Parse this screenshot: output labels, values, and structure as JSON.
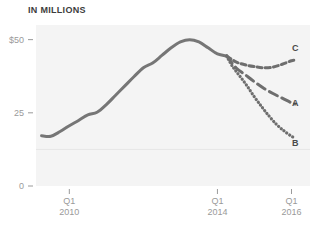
{
  "chart_data": {
    "type": "line",
    "title": "IN MILLIONS",
    "xlabel": "",
    "ylabel": "",
    "ylim": [
      0,
      55
    ],
    "yticks": [
      {
        "value": 50,
        "label": "$50"
      },
      {
        "value": 25,
        "label": "25"
      },
      {
        "value": 0,
        "label": "0"
      }
    ],
    "gridlines": [
      12.5
    ],
    "grid": true,
    "legend_position": "right-inline",
    "xticks": [
      {
        "x": 2010.0,
        "line1": "Q1",
        "line2": "2010"
      },
      {
        "x": 2014.0,
        "line1": "Q1",
        "line2": "2014"
      },
      {
        "x": 2016.0,
        "line1": "Q1",
        "line2": "2016"
      }
    ],
    "xlim": [
      2009.1,
      2016.5
    ],
    "series": [
      {
        "name": "historical",
        "label": "",
        "style": "solid",
        "color": "#767676",
        "x": [
          2009.25,
          2009.5,
          2009.75,
          2010.0,
          2010.25,
          2010.5,
          2010.75,
          2011.0,
          2011.25,
          2011.5,
          2011.75,
          2012.0,
          2012.25,
          2012.5,
          2012.75,
          2013.0,
          2013.25,
          2013.5,
          2013.75,
          2014.0,
          2014.25
        ],
        "values": [
          17.2,
          17.0,
          18.6,
          20.6,
          22.4,
          24.3,
          25.2,
          27.8,
          31.0,
          34.2,
          37.4,
          40.4,
          42.0,
          44.6,
          47.2,
          49.2,
          50.0,
          49.2,
          47.2,
          45.1,
          44.4
        ]
      },
      {
        "name": "projection-c",
        "label": "C",
        "style": "dashed-short",
        "color": "#6e6e6e",
        "x": [
          2014.25,
          2014.5,
          2014.75,
          2015.0,
          2015.25,
          2015.5,
          2015.75,
          2016.0,
          2016.1
        ],
        "values": [
          44.4,
          42.4,
          41.4,
          40.8,
          40.4,
          40.6,
          41.6,
          42.8,
          43.0
        ]
      },
      {
        "name": "projection-a",
        "label": "A",
        "style": "dashed-long",
        "color": "#6e6e6e",
        "x": [
          2014.25,
          2014.5,
          2014.75,
          2015.0,
          2015.25,
          2015.5,
          2015.75,
          2016.0,
          2016.1
        ],
        "values": [
          44.4,
          40.4,
          38.0,
          35.6,
          33.4,
          31.6,
          30.0,
          28.4,
          28.0
        ]
      },
      {
        "name": "projection-b",
        "label": "B",
        "style": "dotted",
        "color": "#6e6e6e",
        "x": [
          2014.25,
          2014.4,
          2014.6,
          2014.8,
          2015.0,
          2015.2,
          2015.4,
          2015.6,
          2015.8,
          2016.0,
          2016.1
        ],
        "values": [
          44.4,
          41.0,
          37.6,
          34.2,
          30.4,
          27.0,
          23.8,
          21.0,
          18.8,
          17.0,
          16.4
        ]
      }
    ],
    "series_labels": [
      {
        "name": "C",
        "x": 292,
        "y": 51
      },
      {
        "name": "A",
        "x": 292,
        "y": 106
      },
      {
        "name": "B",
        "x": 292,
        "y": 146
      }
    ],
    "colors": {
      "plot_background": "#f4f4f4",
      "line": "#767676",
      "axis_text": "#9a9a9a",
      "title_text": "#3d3d3d",
      "gridline": "#e6e6e6",
      "page_background": "#ffffff"
    }
  }
}
